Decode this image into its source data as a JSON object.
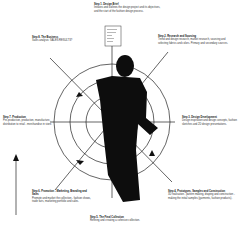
{
  "steps": [
    {
      "title": "Step 1. Design Brief",
      "desc": "Initiates and outlines the design project and its objectives, and the start of the fashion design process."
    },
    {
      "title": "Step 2. Research and Sourcing",
      "desc": "Trend and design research, market research, sourcing and selecting fabrics and colors. Primary and secondary sources."
    },
    {
      "title": "Step 3. Design Development",
      "desc": "Design inspiration and design concepts, fashion sketches and 2D design presentations."
    },
    {
      "title": "Step 4. Prototypes, Samples and Construction",
      "desc": "3D realisation - pattern making, draping and construction - making the initial samples (garments, fashion products)."
    },
    {
      "title": "Step 5. The Final Collection",
      "desc": "Refining and creating a cohesive collection."
    },
    {
      "title": "Step 6. Promotion - Marketing, Branding and Sales",
      "desc": "Promote and market the collection - fashion shows, trade fairs, marketing portfolio and sales."
    },
    {
      "title": "Step 7. Production",
      "desc": "Pre-production, production, manufacture, distribution to retail - merchandise in store."
    },
    {
      "title": "Step 8. The Business",
      "desc": "Sales analysis: SALES RESULTS?"
    }
  ],
  "brief_card": {
    "lines": [
      "Design Brief",
      "Client / Brand",
      "Target",
      "Budget",
      "Timeline",
      "Details"
    ]
  }
}
